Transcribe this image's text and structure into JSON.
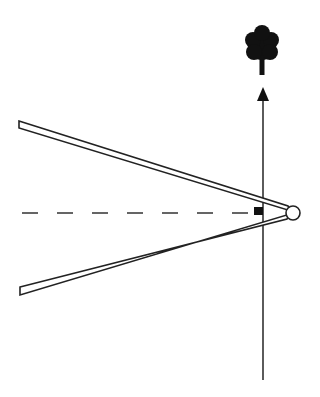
{
  "diagram": {
    "type": "mirror-angle-line-drawing",
    "colors": {
      "stroke": "#1a1a1a",
      "fill": "#ffffff",
      "background": "#ffffff"
    },
    "elements": {
      "tree_icon": "tree-icon",
      "arrow": "arrow-up-icon",
      "hinge": "hinge-circle",
      "right_angle_marker": "right-angle-square"
    }
  }
}
